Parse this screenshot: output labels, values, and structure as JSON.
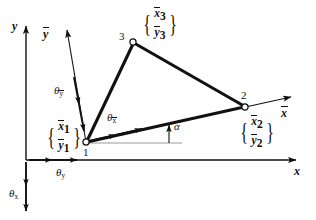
{
  "figure": {
    "type": "coordinate-transformation-diagram",
    "ink_color": "#111111",
    "background_color": "#ffffff",
    "thin_ref_color": "#9a9a9a"
  },
  "global_axes": {
    "x_label": "x",
    "y_label": "y",
    "rotation_x_label": "θ",
    "rotation_x_sub": "x",
    "rotation_y_label": "θ",
    "rotation_y_sub": "y"
  },
  "local_axes": {
    "x_label": "x",
    "x_overbar": true,
    "y_label": "y",
    "y_overbar": true,
    "rotation_xbar_label": "θ",
    "rotation_xbar_sub": "x",
    "rotation_ybar_label": "θ",
    "rotation_ybar_sub": "y",
    "angle_label": "α"
  },
  "nodes": [
    {
      "id": "1",
      "number": "1",
      "x": 86,
      "y": 142,
      "vector": {
        "top": "x",
        "top_sub": "1",
        "bottom": "y",
        "bottom_sub": "1"
      }
    },
    {
      "id": "2",
      "number": "2",
      "x": 245,
      "y": 107,
      "vector": {
        "top": "x",
        "top_sub": "2",
        "bottom": "y",
        "bottom_sub": "2"
      }
    },
    {
      "id": "3",
      "number": "3",
      "x": 133,
      "y": 42,
      "vector": {
        "top": "x",
        "top_sub": "3",
        "bottom": "y",
        "bottom_sub": "3"
      }
    }
  ],
  "element_edges": [
    {
      "from": "1",
      "to": "3"
    },
    {
      "from": "3",
      "to": "2"
    },
    {
      "from": "1",
      "to": "2"
    }
  ],
  "braces": {
    "left_brace": "{",
    "right_brace": "}"
  }
}
